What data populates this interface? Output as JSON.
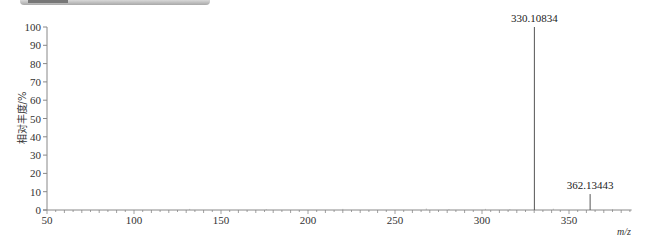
{
  "header": {
    "visible_text": ""
  },
  "chart_data": {
    "type": "bar",
    "subtype": "mass-spectrum-stick",
    "title": "",
    "xlabel": "m/z",
    "ylabel": "相对丰度/%",
    "xlim": [
      50,
      386
    ],
    "ylim": [
      0,
      100
    ],
    "x_ticks": [
      50,
      100,
      150,
      200,
      250,
      300,
      350
    ],
    "y_ticks": [
      0,
      10,
      20,
      30,
      40,
      50,
      60,
      70,
      80,
      90,
      100
    ],
    "grid": false,
    "legend": null,
    "series": [
      {
        "name": "spectrum",
        "x": [
          330.10834,
          362.13443
        ],
        "values": [
          100,
          8.7
        ]
      }
    ],
    "annotations": [
      {
        "x": 330.10834,
        "y": 100,
        "text": "330.10834"
      },
      {
        "x": 362.13443,
        "y": 8.7,
        "text": "362.13443"
      }
    ]
  },
  "colors": {
    "axis": "#888888",
    "peak": "#555555",
    "text": "#333333"
  }
}
